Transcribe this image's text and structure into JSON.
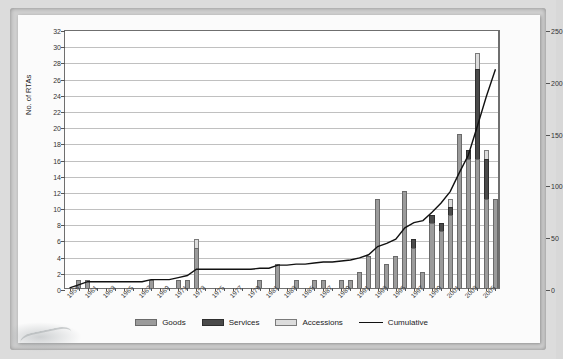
{
  "chart_data": {
    "type": "bar",
    "title": "",
    "subtitle": "",
    "xlabel": "",
    "ylabel": "No. of RTAs",
    "ylabel_right": "",
    "ylim": [
      0,
      32
    ],
    "ytick_step": 2,
    "ylim_right": [
      0,
      250
    ],
    "ytick_step_right": 50,
    "grid": true,
    "legend_position": "bottom",
    "stacked": true,
    "yticks": [
      0,
      2,
      4,
      6,
      8,
      10,
      12,
      14,
      16,
      18,
      20,
      22,
      24,
      26,
      28,
      30,
      32
    ],
    "yticks_right": [
      0,
      50,
      100,
      150,
      200,
      250
    ],
    "x": [
      1959,
      1960,
      1961,
      1962,
      1963,
      1964,
      1965,
      1966,
      1967,
      1968,
      1969,
      1970,
      1971,
      1972,
      1973,
      1974,
      1975,
      1976,
      1977,
      1978,
      1979,
      1980,
      1981,
      1982,
      1983,
      1984,
      1985,
      1986,
      1987,
      1988,
      1989,
      1990,
      1991,
      1992,
      1993,
      1994,
      1995,
      1996,
      1997,
      1998,
      1999,
      2000,
      2001,
      2002,
      2003,
      2004,
      2005,
      2006
    ],
    "xtick_labels": [
      "1959",
      "1961",
      "1963",
      "1965",
      "1967",
      "1969",
      "1971",
      "1973",
      "1975",
      "1977",
      "1979",
      "1981",
      "1983",
      "1985",
      "1987",
      "1989",
      "1991",
      "1993",
      "1995",
      "1997",
      "1999",
      "2001",
      "2003",
      "2005"
    ],
    "series": [
      {
        "name": "Goods",
        "color": "#9b9b9b",
        "values": [
          0,
          1,
          1,
          0,
          0,
          0,
          0,
          0,
          0,
          1,
          0,
          0,
          1,
          1,
          5,
          0,
          0,
          0,
          0,
          0,
          0,
          1,
          0,
          3,
          0,
          1,
          0,
          1,
          1,
          0,
          1,
          1,
          2,
          4,
          11,
          3,
          4,
          12,
          5,
          2,
          8,
          7,
          9,
          19,
          16,
          16,
          11,
          11
        ]
      },
      {
        "name": "Services",
        "color": "#4a4a4a",
        "values": [
          0,
          0,
          0,
          0,
          0,
          0,
          0,
          0,
          0,
          0,
          0,
          0,
          0,
          0,
          0,
          0,
          0,
          0,
          0,
          0,
          0,
          0,
          0,
          0,
          0,
          0,
          0,
          0,
          0,
          0,
          0,
          0,
          0,
          0,
          0,
          0,
          0,
          0,
          1,
          0,
          1,
          1,
          1,
          0,
          1,
          11,
          5,
          0
        ]
      },
      {
        "name": "Accessions",
        "color": "#dcdcdc",
        "values": [
          0,
          0,
          0,
          0,
          0,
          0,
          0,
          0,
          0,
          0,
          0,
          0,
          0,
          0,
          1,
          0,
          0,
          0,
          0,
          0,
          0,
          0,
          0,
          0,
          0,
          0,
          0,
          0,
          0,
          0,
          0,
          0,
          0,
          0,
          0,
          0,
          0,
          0,
          0,
          0,
          0,
          0,
          1,
          0,
          0,
          2,
          1,
          0
        ]
      },
      {
        "name": "Cumulative",
        "color": "#111111",
        "type": "line",
        "axis": "right",
        "values": [
          2,
          5,
          8,
          8,
          8,
          8,
          8,
          8,
          8,
          10,
          10,
          10,
          12,
          14,
          20,
          20,
          20,
          20,
          20,
          20,
          20,
          21,
          21,
          24,
          24,
          25,
          25,
          26,
          27,
          27,
          28,
          29,
          31,
          34,
          42,
          45,
          49,
          60,
          65,
          67,
          75,
          84,
          95,
          113,
          130,
          158,
          187,
          213
        ]
      }
    ]
  },
  "legend": {
    "items": [
      {
        "label": "Goods",
        "swatch": "goods-swatch"
      },
      {
        "label": "Services",
        "swatch": "services-swatch"
      },
      {
        "label": "Accessions",
        "swatch": "accessions-swatch"
      },
      {
        "label": "Cumulative",
        "swatch": "cumulative-line"
      }
    ]
  }
}
